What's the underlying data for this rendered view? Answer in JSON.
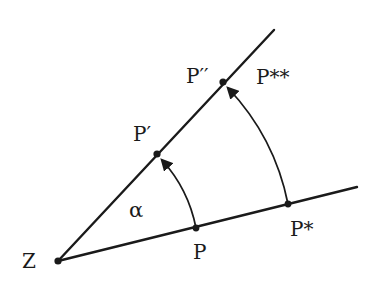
{
  "diagram": {
    "type": "geometry",
    "colors": {
      "stroke": "#1a1a1a",
      "background": "#ffffff"
    },
    "points": {
      "Z": {
        "label": "Z",
        "x": 58,
        "y": 261
      },
      "P": {
        "label": "P",
        "x": 196,
        "y": 228
      },
      "P_star": {
        "label": "P*",
        "x": 288,
        "y": 204
      },
      "P_prime": {
        "label": "P′",
        "x": 157,
        "y": 154
      },
      "P_double_prime": {
        "label": "P′′",
        "x": 223,
        "y": 82
      },
      "P_double_star": {
        "label": "P**"
      }
    },
    "angle_label": "α",
    "rays": [
      {
        "from": "Z",
        "to": [
          357,
          187
        ],
        "through": [
          "P",
          "P*"
        ]
      },
      {
        "from": "Z",
        "to": [
          274,
          30
        ],
        "through": [
          "P′",
          "P′′"
        ]
      }
    ],
    "arcs": [
      {
        "from": "P",
        "to": "P′",
        "arrow": "end"
      },
      {
        "from": "P*",
        "to": "P′′",
        "arrow": "end"
      }
    ]
  }
}
